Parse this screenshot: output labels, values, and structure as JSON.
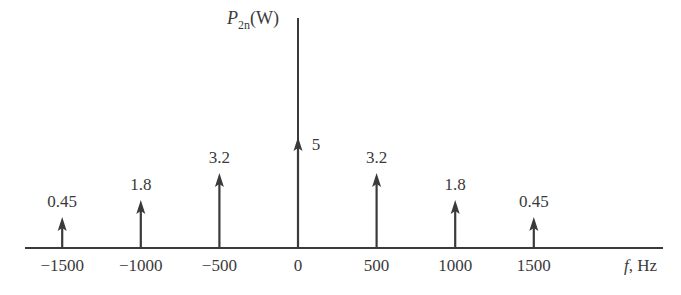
{
  "chart_data": {
    "type": "stem",
    "title": "",
    "xlabel": "f, Hz",
    "ylabel": "P2n(W)",
    "x": [
      -1500,
      -1000,
      -500,
      0,
      500,
      1000,
      1500
    ],
    "values": [
      0.45,
      1.8,
      3.2,
      5,
      3.2,
      1.8,
      0.45
    ],
    "value_labels": [
      "0.45",
      "1.8",
      "3.2",
      "5",
      "3.2",
      "1.8",
      "0.45"
    ],
    "x_tick_labels": [
      "−1500",
      "−1000",
      "−500",
      "0",
      "500",
      "1000",
      "1500"
    ],
    "grid": false,
    "legend": null
  },
  "axis": {
    "ylabel_main": "P",
    "ylabel_sub": "2n",
    "ylabel_unit": "(W)",
    "xlabel_var": "f",
    "xlabel_unit": ", Hz"
  },
  "colors": {
    "stroke": "#3a3a3a"
  }
}
